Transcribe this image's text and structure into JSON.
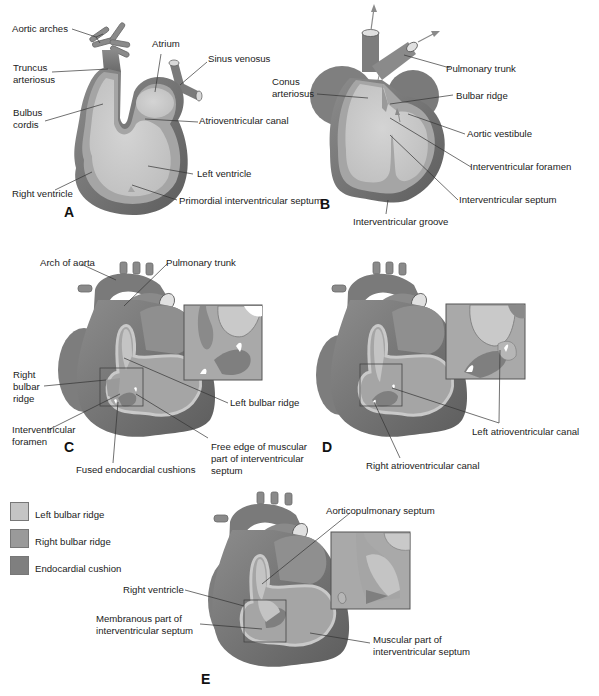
{
  "colors": {
    "outer_wall": "#7d7d7d",
    "outer_wall_dark": "#5e5e5e",
    "inner_wall": "#a9a9a9",
    "lumen": "#c9c9c9",
    "lumen_light": "#d6d6d6",
    "leader_line": "#333333",
    "left_bulbar_ridge": "#c4c4c4",
    "right_bulbar_ridge": "#9a9a9a",
    "endocardial_cushion": "#7f7f7f"
  },
  "panels": {
    "A": {
      "letter": "A",
      "labels": {
        "aortic_arches": "Aortic arches",
        "truncus_arteriosus_1": "Truncus",
        "truncus_arteriosus_2": "arteriosus",
        "atrium": "Atrium",
        "sinus_venosus": "Sinus venosus",
        "bulbus_cordis_1": "Bulbus",
        "bulbus_cordis_2": "cordis",
        "atrioventricular_canal": "Atrioventricular canal",
        "left_ventricle": "Left ventricle",
        "right_ventricle": "Right ventricle",
        "primordial_iv_septum": "Primordial interventricular septum"
      }
    },
    "B": {
      "letter": "B",
      "labels": {
        "pulmonary_trunk": "Pulmonary trunk",
        "conus_arteriosus_1": "Conus",
        "conus_arteriosus_2": "arteriosus",
        "bulbar_ridge": "Bulbar ridge",
        "aortic_vestibule": "Aortic vestibule",
        "interventricular_foramen": "Interventricular foramen",
        "interventricular_septum": "Interventricular septum",
        "interventricular_groove": "Interventricular groove"
      }
    },
    "C": {
      "letter": "C",
      "labels": {
        "arch_of_aorta": "Arch of aorta",
        "pulmonary_trunk": "Pulmonary trunk",
        "right_bulbar_ridge_1": "Right",
        "right_bulbar_ridge_2": "bulbar",
        "right_bulbar_ridge_3": "ridge",
        "left_bulbar_ridge": "Left bulbar ridge",
        "interventricular_foramen_1": "Interventricular",
        "interventricular_foramen_2": "foramen",
        "free_edge_1": "Free edge of muscular",
        "free_edge_2": "part of interventricular",
        "free_edge_3": "septum",
        "fused_endocardial_cushions": "Fused endocardial cushions"
      }
    },
    "D": {
      "letter": "D",
      "labels": {
        "left_av_canal": "Left atrioventricular canal",
        "right_av_canal": "Right atrioventricular canal"
      }
    },
    "E": {
      "letter": "E",
      "labels": {
        "aorticopulmonary_septum": "Aorticopulmonary septum",
        "right_ventricle": "Right ventricle",
        "membranous_part_1": "Membranous part of",
        "membranous_part_2": "interventricular septum",
        "muscular_part_1": "Muscular part of",
        "muscular_part_2": "interventricular septum"
      }
    }
  },
  "legend": {
    "items": [
      {
        "label": "Left bulbar ridge",
        "color": "#c4c4c4"
      },
      {
        "label": "Right bulbar ridge",
        "color": "#9a9a9a"
      },
      {
        "label": "Endocardial cushion",
        "color": "#7f7f7f"
      }
    ]
  }
}
